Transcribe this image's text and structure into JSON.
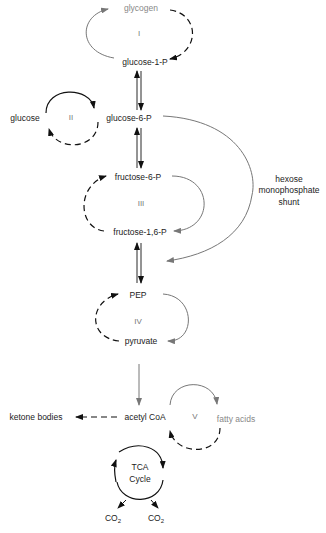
{
  "diagram": {
    "colors": {
      "gray_arrow": "#777777",
      "black_arrow": "#111111",
      "gray_text": "#888888",
      "text": "#222222"
    },
    "nodes": {
      "glycogen": "glycogen",
      "glucose_1_p": "glucose-1-P",
      "glucose": "glucose",
      "glucose_6_p": "glucose-6-P",
      "fructose_6_p": "fructose-6-P",
      "fructose_1_6_p": "fructose-1,6-P",
      "pep": "PEP",
      "pyruvate": "pyruvate",
      "ketone_bodies": "ketone bodies",
      "acetyl_coa": "acetyl  CoA",
      "fatty_acids": "fatty acids",
      "tca_line1": "TCA",
      "tca_line2": "Cycle",
      "co2_left": "CO",
      "co2_right": "CO",
      "co2_sub": "2"
    },
    "cycles": {
      "c1": "I",
      "c2": "II",
      "c3": "III",
      "c4": "IV",
      "c5": "V"
    },
    "shunt": {
      "line1": "hexose",
      "line2": "monophosphate",
      "line3": "shunt"
    },
    "edges": [
      {
        "from": "glucose-1-P",
        "to": "glycogen",
        "style": "solid",
        "color": "gray"
      },
      {
        "from": "glycogen",
        "to": "glucose-1-P",
        "style": "dashed",
        "color": "black"
      },
      {
        "from": "glucose-1-P",
        "to": "glucose-6-P",
        "style": "solid-bidirectional",
        "color": "black"
      },
      {
        "from": "glucose",
        "to": "glucose-6-P",
        "style": "solid",
        "color": "black"
      },
      {
        "from": "glucose-6-P",
        "to": "glucose",
        "style": "dashed",
        "color": "black"
      },
      {
        "from": "glucose-6-P",
        "to": "fructose-6-P",
        "style": "solid-bidirectional",
        "color": "black"
      },
      {
        "from": "glucose-6-P",
        "to": "fructose-1,6-P/PEP region",
        "style": "solid",
        "color": "gray",
        "label": "hexose monophosphate shunt"
      },
      {
        "from": "fructose-6-P",
        "to": "fructose-1,6-P",
        "style": "solid",
        "color": "gray"
      },
      {
        "from": "fructose-1,6-P",
        "to": "fructose-6-P",
        "style": "dashed",
        "color": "black"
      },
      {
        "from": "fructose-1,6-P",
        "to": "PEP",
        "style": "solid-bidirectional",
        "color": "black"
      },
      {
        "from": "PEP",
        "to": "pyruvate",
        "style": "solid",
        "color": "gray"
      },
      {
        "from": "pyruvate",
        "to": "PEP",
        "style": "dashed",
        "color": "black"
      },
      {
        "from": "pyruvate",
        "to": "acetyl CoA",
        "style": "solid",
        "color": "gray"
      },
      {
        "from": "acetyl CoA",
        "to": "ketone bodies",
        "style": "dashed",
        "color": "black"
      },
      {
        "from": "acetyl CoA",
        "to": "fatty acids",
        "style": "solid",
        "color": "gray"
      },
      {
        "from": "fatty acids",
        "to": "acetyl CoA",
        "style": "dashed",
        "color": "black"
      },
      {
        "from": "TCA Cycle",
        "to": "CO2",
        "style": "solid",
        "color": "black"
      },
      {
        "from": "TCA Cycle",
        "to": "CO2",
        "style": "solid",
        "color": "black"
      }
    ]
  }
}
